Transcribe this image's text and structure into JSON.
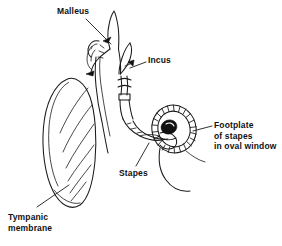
{
  "figure": {
    "background_color": "#ffffff",
    "ink_color": "#1a1a1a",
    "width": 282,
    "height": 246
  },
  "labels": {
    "malleus": "Malleus",
    "incus": "Incus",
    "stapes": "Stapes",
    "tympanic_line1": "Tympanic",
    "tympanic_line2": "membrane",
    "footplate_line1": "Footplate",
    "footplate_line2": "of  stapes",
    "footplate_line3": "in  oval  window"
  },
  "parts": {
    "tympanic_membrane": "tympanic-membrane",
    "malleus": "malleus-bone",
    "incus": "incus-bone",
    "stapes": "stapes-bone",
    "footplate": "stapes-footplate",
    "oval_window": "oval-window"
  }
}
